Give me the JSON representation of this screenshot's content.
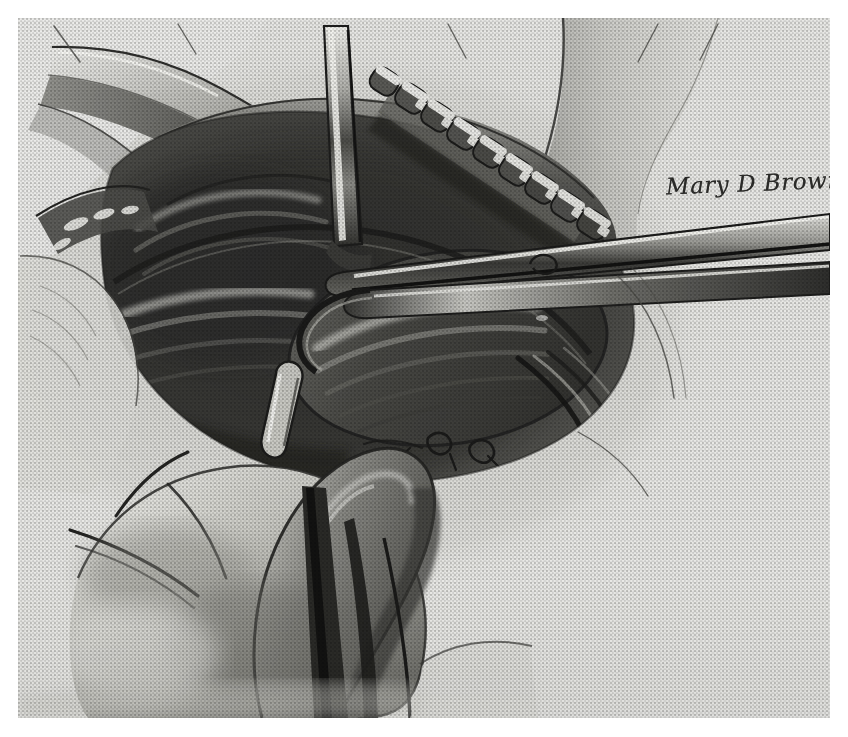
{
  "plate": {
    "medium": "halftone-printed pencil illustration",
    "subject": "surgical field illustration",
    "paper_color": "#e9e9e6",
    "ink_color": "#2a2a28",
    "midtone_color": "#7d7d79",
    "highlight_color": "#f2f2ee",
    "background_color": "#ffffff",
    "margins": {
      "left": 18,
      "top": 18,
      "right": 18,
      "bottom": 19
    },
    "plate_size": {
      "width": 812,
      "height": 700
    }
  },
  "signature": {
    "text": "Mary D Brown",
    "x": 666,
    "y": 170,
    "font_size": 23,
    "rotation": -2.2
  },
  "elements": {
    "drape_upper_left": "surgical drape fold, upper left",
    "drape_right": "surgical drape edge, right of field",
    "clip_row": "row of surgical clips / hemostatic clip applier jaws",
    "clip_count": 9,
    "retractor_blade": "narrow retractor blade entering from top center",
    "forceps_upper": "long forceps shaft crossing from right",
    "forceps_lower": "second instrument shaft below, crossing to right edge",
    "probe": "small blunt probe tip in center of field",
    "hand": "surgeon's hand and thumb, lower left, holding instrument",
    "wound_cavity": "dark open wound cavity with tissue planes"
  }
}
